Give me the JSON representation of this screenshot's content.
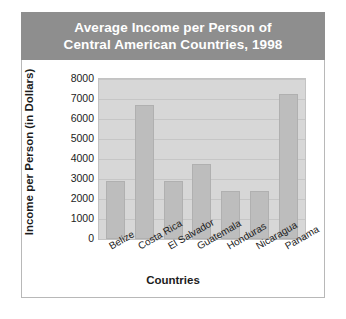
{
  "title": {
    "line1": "Average Income per Person of",
    "line2": "Central American Countries, 1998",
    "background": "#8e8e8e",
    "color": "#ffffff"
  },
  "axes": {
    "x_label": "Countries",
    "y_label_line1": "Income per Person",
    "y_label_line2": "(in Dollars)"
  },
  "chart_data": {
    "type": "bar",
    "title": "Average Income per Person of Central American Countries, 1998",
    "xlabel": "Countries",
    "ylabel": "Income per Person (in Dollars)",
    "categories": [
      "Belize",
      "Costa Rica",
      "El Salvador",
      "Guatemala",
      "Honduras",
      "Nicaragua",
      "Panama"
    ],
    "values": [
      2900,
      6700,
      2900,
      3750,
      2400,
      2400,
      7250
    ],
    "ylim": [
      0,
      8000
    ],
    "yticks": [
      0,
      1000,
      2000,
      3000,
      4000,
      5000,
      6000,
      7000,
      8000
    ],
    "ytick_labels": [
      "0",
      "1000",
      "2000",
      "3000",
      "4000",
      "5000",
      "6000",
      "7000",
      "8000"
    ],
    "grid": true,
    "legend": false,
    "bar_color": "#bdbdbd",
    "plot_background": "#d7d7d7"
  }
}
